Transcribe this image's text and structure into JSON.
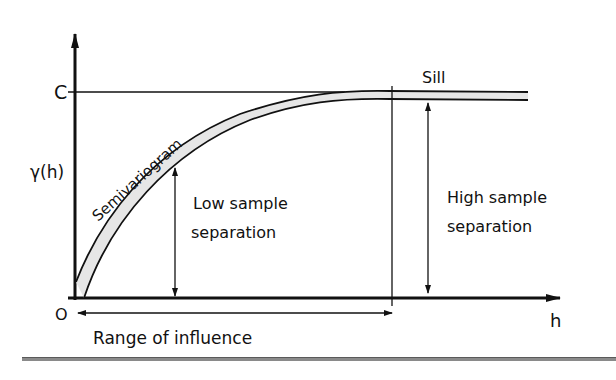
{
  "diagram": {
    "type": "semivariogram-sketch",
    "labels": {
      "y_axis_symbol": "γ(h)",
      "origin": "O",
      "x_axis_symbol": "h",
      "sill_level": "C",
      "sill": "Sill",
      "curve": "Semivariogram",
      "low_sep_line1": "Low sample",
      "low_sep_line2": "separation",
      "high_sep_line1": "High sample",
      "high_sep_line2": "separation",
      "range": "Range of influence"
    },
    "colors": {
      "ink": "#111111",
      "curve_fill": "#e6e6e6",
      "rule": "#8a8a8a"
    }
  }
}
